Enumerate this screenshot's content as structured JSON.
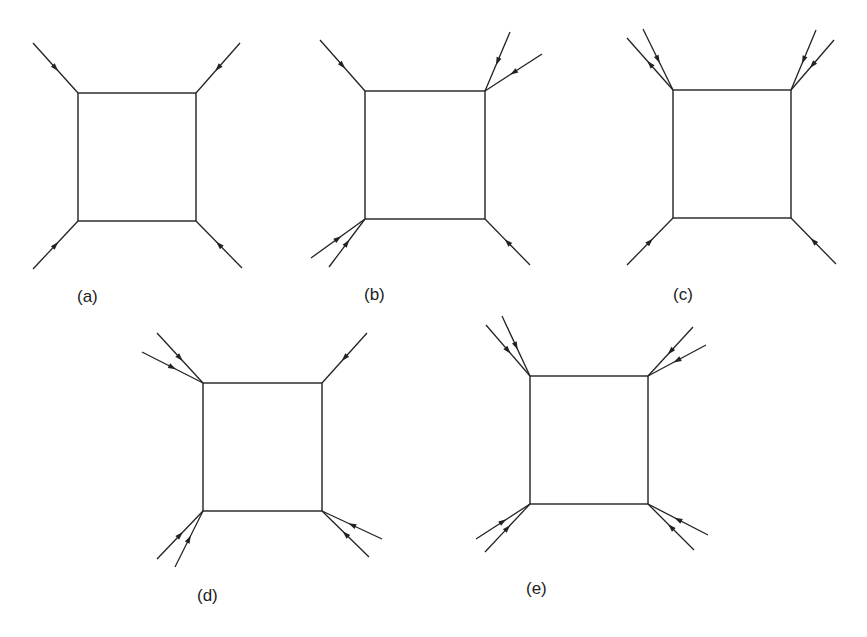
{
  "figure": {
    "line_color": "#222222",
    "background": "#ffffff",
    "diagrams": [
      {
        "id": "a",
        "label": "(a)",
        "label_pos": [
          77,
          288
        ],
        "box": {
          "x1": 78,
          "y1": 93,
          "x2": 196,
          "y2": 221
        },
        "legs": [
          {
            "corner": "top-left",
            "from": [
              33,
              43
            ],
            "to": [
              78,
              93
            ],
            "arrow": "in"
          },
          {
            "corner": "top-right",
            "from": [
              240,
              43
            ],
            "to": [
              196,
              93
            ],
            "arrow": "in"
          },
          {
            "corner": "bottom-left",
            "from": [
              33,
              269
            ],
            "to": [
              78,
              221
            ],
            "arrow": "in"
          },
          {
            "corner": "bottom-right",
            "from": [
              242,
              268
            ],
            "to": [
              196,
              221
            ],
            "arrow": "in"
          }
        ]
      },
      {
        "id": "b",
        "label": "(b)",
        "label_pos": [
          364,
          286
        ],
        "box": {
          "x1": 365,
          "y1": 91,
          "x2": 485,
          "y2": 219
        },
        "legs": [
          {
            "corner": "top-left",
            "from": [
              320,
              40
            ],
            "to": [
              365,
              91
            ],
            "arrow": "in"
          },
          {
            "corner": "top-right",
            "from": [
              510,
              32
            ],
            "to": [
              485,
              91
            ],
            "arrow": "in"
          },
          {
            "corner": "top-right",
            "from": [
              542,
              54
            ],
            "to": [
              485,
              91
            ],
            "arrow": "in"
          },
          {
            "corner": "bottom-left",
            "from": [
              311,
              258
            ],
            "to": [
              365,
              219
            ],
            "arrow": "in"
          },
          {
            "corner": "bottom-left",
            "from": [
              329,
              267
            ],
            "to": [
              365,
              219
            ],
            "arrow": "in"
          },
          {
            "corner": "bottom-right",
            "from": [
              530,
              265
            ],
            "to": [
              485,
              219
            ],
            "arrow": "in"
          }
        ]
      },
      {
        "id": "c",
        "label": "(c)",
        "label_pos": [
          673,
          286
        ],
        "box": {
          "x1": 673,
          "y1": 90,
          "x2": 791,
          "y2": 218
        },
        "legs": [
          {
            "corner": "top-left",
            "from": [
              643,
              29
            ],
            "to": [
              673,
              90
            ],
            "arrow": "in"
          },
          {
            "corner": "top-left",
            "from": [
              627,
              38
            ],
            "to": [
              673,
              90
            ],
            "arrow": "out"
          },
          {
            "corner": "top-right",
            "from": [
              816,
              30
            ],
            "to": [
              791,
              90
            ],
            "arrow": "in"
          },
          {
            "corner": "top-right",
            "from": [
              834,
              40
            ],
            "to": [
              791,
              90
            ],
            "arrow": "in"
          },
          {
            "corner": "bottom-left",
            "from": [
              627,
              265
            ],
            "to": [
              673,
              218
            ],
            "arrow": "in"
          },
          {
            "corner": "bottom-right",
            "from": [
              836,
              264
            ],
            "to": [
              791,
              218
            ],
            "arrow": "in"
          }
        ]
      },
      {
        "id": "d",
        "label": "(d)",
        "label_pos": [
          197,
          587
        ],
        "box": {
          "x1": 203,
          "y1": 383,
          "x2": 322,
          "y2": 511
        },
        "legs": [
          {
            "corner": "top-left",
            "from": [
              157,
              333
            ],
            "to": [
              203,
              383
            ],
            "arrow": "in"
          },
          {
            "corner": "top-left",
            "from": [
              142,
              352
            ],
            "to": [
              203,
              383
            ],
            "arrow": "in"
          },
          {
            "corner": "top-right",
            "from": [
              367,
              333
            ],
            "to": [
              322,
              383
            ],
            "arrow": "in"
          },
          {
            "corner": "bottom-left",
            "from": [
              157,
              559
            ],
            "to": [
              203,
              511
            ],
            "arrow": "in"
          },
          {
            "corner": "bottom-left",
            "from": [
              175,
              567
            ],
            "to": [
              203,
              511
            ],
            "arrow": "in"
          },
          {
            "corner": "bottom-right",
            "from": [
              382,
              539
            ],
            "to": [
              322,
              511
            ],
            "arrow": "in"
          },
          {
            "corner": "bottom-right",
            "from": [
              369,
              557
            ],
            "to": [
              322,
              511
            ],
            "arrow": "in"
          }
        ]
      },
      {
        "id": "e",
        "label": "(e)",
        "label_pos": [
          526,
          580
        ],
        "box": {
          "x1": 530,
          "y1": 376,
          "x2": 648,
          "y2": 504
        },
        "legs": [
          {
            "corner": "top-left",
            "from": [
              502,
              316
            ],
            "to": [
              530,
              376
            ],
            "arrow": "in"
          },
          {
            "corner": "top-left",
            "from": [
              486,
              325
            ],
            "to": [
              530,
              376
            ],
            "arrow": "in"
          },
          {
            "corner": "top-right",
            "from": [
              693,
              327
            ],
            "to": [
              648,
              376
            ],
            "arrow": "in"
          },
          {
            "corner": "top-right",
            "from": [
              706,
              345
            ],
            "to": [
              648,
              376
            ],
            "arrow": "in"
          },
          {
            "corner": "bottom-left",
            "from": [
              476,
              539
            ],
            "to": [
              530,
              504
            ],
            "arrow": "in"
          },
          {
            "corner": "bottom-left",
            "from": [
              485,
              552
            ],
            "to": [
              530,
              504
            ],
            "arrow": "in"
          },
          {
            "corner": "bottom-right",
            "from": [
              708,
              535
            ],
            "to": [
              648,
              504
            ],
            "arrow": "in"
          },
          {
            "corner": "bottom-right",
            "from": [
              694,
              550
            ],
            "to": [
              648,
              504
            ],
            "arrow": "in"
          }
        ]
      }
    ]
  }
}
